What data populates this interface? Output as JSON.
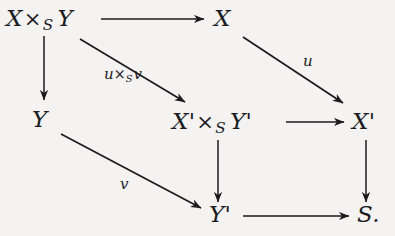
{
  "diagram": {
    "type": "commutative-diagram",
    "background_color": "#f4f3f1",
    "ink_color": "#1b1b1f",
    "nodes": [
      {
        "id": "XxSY",
        "tex": "X \\times_S Y",
        "base": "X",
        "op": "×",
        "sub": "S",
        "second": "Y",
        "x": 6,
        "y": 7,
        "plain": "X ×S Y"
      },
      {
        "id": "X",
        "tex": "X",
        "base": "X",
        "op": "",
        "sub": "",
        "second": "",
        "x": 214,
        "y": 7,
        "plain": "X"
      },
      {
        "id": "Y",
        "tex": "Y",
        "base": "Y",
        "op": "",
        "sub": "",
        "second": "",
        "x": 32,
        "y": 108,
        "plain": "Y"
      },
      {
        "id": "XpxSYp",
        "tex": "X' \\times_S Y'",
        "base": "X'",
        "op": "×",
        "sub": "S",
        "second": "Y'",
        "x": 172,
        "y": 110,
        "plain": "X′ ×S Y′"
      },
      {
        "id": "Xp",
        "tex": "X'",
        "base": "X'",
        "op": "",
        "sub": "",
        "second": "",
        "x": 352,
        "y": 110,
        "plain": "X′"
      },
      {
        "id": "Yp",
        "tex": "Y'",
        "base": "Y'",
        "op": "",
        "sub": "",
        "second": "",
        "x": 209,
        "y": 203,
        "plain": "Y′"
      },
      {
        "id": "S",
        "tex": "S.",
        "base": "S.",
        "op": "",
        "sub": "",
        "second": "",
        "x": 357,
        "y": 203,
        "plain": "S."
      }
    ],
    "arrows": [
      {
        "id": "top-horizontal",
        "from": "XxSY",
        "to": "X",
        "label": "",
        "kind": "horizontal",
        "x1": 101,
        "y1": 19,
        "x2": 205,
        "y2": 19
      },
      {
        "id": "left-vertical",
        "from": "XxSY",
        "to": "Y",
        "label": "",
        "kind": "vertical",
        "x1": 44,
        "y1": 36,
        "x2": 44,
        "y2": 101
      },
      {
        "id": "diagonal-uxsv",
        "from": "XxSY",
        "to": "XpxSYp",
        "label": "u×Sv",
        "kind": "diagonal",
        "x1": 80,
        "y1": 39,
        "x2": 186,
        "y2": 103
      },
      {
        "id": "diagonal-u",
        "from": "X",
        "to": "Xp",
        "label": "u",
        "kind": "diagonal",
        "x1": 243,
        "y1": 37,
        "x2": 344,
        "y2": 104
      },
      {
        "id": "diagonal-v",
        "from": "Y",
        "to": "Yp",
        "label": "v",
        "kind": "diagonal",
        "x1": 61,
        "y1": 134,
        "x2": 202,
        "y2": 209
      },
      {
        "id": "mid-horizontal",
        "from": "XpxSYp",
        "to": "Xp",
        "label": "",
        "kind": "horizontal",
        "x1": 286,
        "y1": 122,
        "x2": 345,
        "y2": 122
      },
      {
        "id": "mid-vertical",
        "from": "XpxSYp",
        "to": "Yp",
        "label": "",
        "kind": "vertical",
        "x1": 218,
        "y1": 140,
        "x2": 218,
        "y2": 203
      },
      {
        "id": "right-vertical",
        "from": "Xp",
        "to": "S",
        "label": "",
        "kind": "vertical",
        "x1": 366,
        "y1": 140,
        "x2": 366,
        "y2": 203
      },
      {
        "id": "bottom-horizontal",
        "from": "Yp",
        "to": "S",
        "label": "",
        "kind": "horizontal",
        "x1": 243,
        "y1": 216,
        "x2": 350,
        "y2": 216
      }
    ],
    "arrow_labels": {
      "uxsv": {
        "base": "u",
        "op": "×",
        "sub": "S",
        "second": "v",
        "x": 104,
        "y": 67,
        "plain": "u ×S v"
      },
      "u": {
        "base": "u",
        "op": "",
        "sub": "",
        "second": "",
        "x": 303,
        "y": 54,
        "plain": "u"
      },
      "v": {
        "base": "v",
        "op": "",
        "sub": "",
        "second": "",
        "x": 120,
        "y": 177,
        "plain": "v"
      }
    }
  }
}
